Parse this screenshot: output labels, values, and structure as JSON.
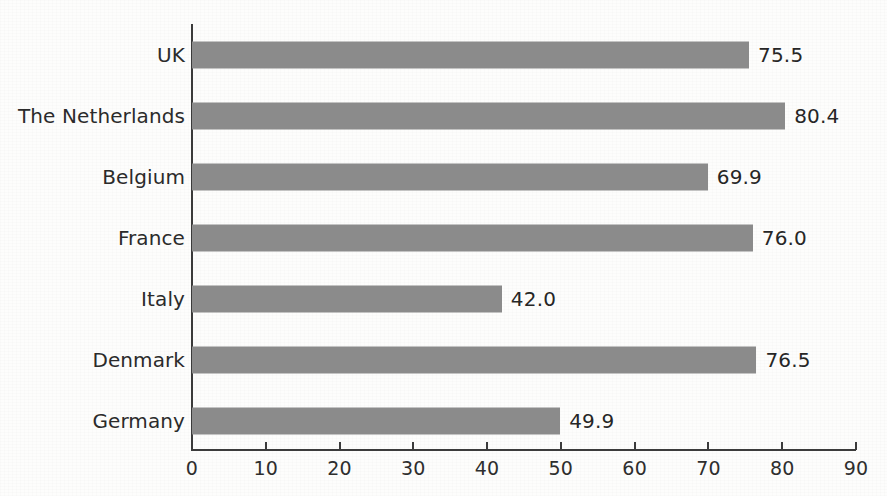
{
  "chart_data": {
    "type": "bar",
    "orientation": "horizontal",
    "title": "",
    "subtitle": "",
    "xlabel": "",
    "ylabel": "",
    "categories": [
      "UK",
      "The Netherlands",
      "Belgium",
      "France",
      "Italy",
      "Denmark",
      "Germany"
    ],
    "values": [
      75.5,
      80.4,
      69.9,
      76.0,
      42.0,
      76.5,
      49.9
    ],
    "value_labels": [
      "75.5",
      "80.4",
      "69.9",
      "76.0",
      "42.0",
      "76.5",
      "49.9"
    ],
    "xlim": [
      0,
      90
    ],
    "xticks": [
      0,
      10,
      20,
      30,
      40,
      50,
      60,
      70,
      80,
      90
    ],
    "xtick_labels": [
      "0",
      "10",
      "20",
      "30",
      "40",
      "50",
      "60",
      "70",
      "80",
      "90"
    ],
    "grid": false,
    "legend": null,
    "bar_color": "#8b8b8b",
    "axis_color": "#3b3b3b",
    "text_color": "#2b2b2b",
    "background_color": "#fdfdfc"
  }
}
